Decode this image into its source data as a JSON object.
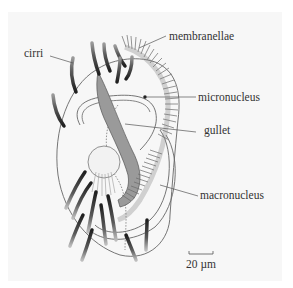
{
  "diagram": {
    "labels": {
      "cirri": "cirri",
      "membranellae": "membranellae",
      "micronucleus": "micronucleus",
      "gullet": "gullet",
      "macronucleus": "macronucleus"
    },
    "scale_bar": {
      "label": "20 µm"
    },
    "colors": {
      "background": "#f7f7f7",
      "outline": "#555555",
      "gullet_fill": "#9a9a9a",
      "cirri_dark": "#2a2a2a",
      "leader_line": "#555555",
      "label_text": "#333333"
    }
  }
}
